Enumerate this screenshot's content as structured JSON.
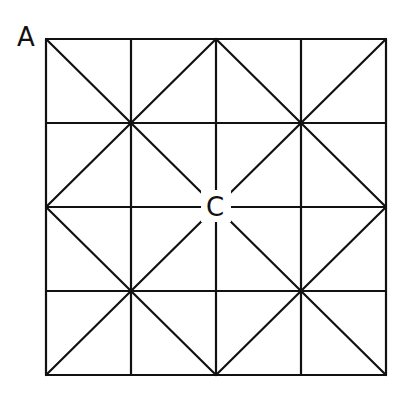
{
  "diagram": {
    "labels": {
      "corner": "A",
      "center": "C"
    },
    "grid": {
      "rows": 4,
      "cols": 4,
      "x": [
        46,
        131,
        216,
        301,
        386
      ],
      "y": [
        39,
        123,
        207,
        291,
        375
      ]
    },
    "stroke_color": "#111111",
    "background_color": "#ffffff"
  }
}
